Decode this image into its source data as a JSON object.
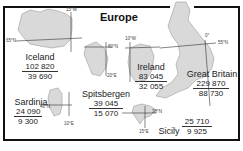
{
  "title": "Europe",
  "units": {
    "top": "km²",
    "bottom": "mi²"
  },
  "islands": [
    {
      "name": "Iceland",
      "area_km2": "102 820",
      "area_mi2": "39 690",
      "coords": [
        "15°W",
        "65°N"
      ]
    },
    {
      "name": "Spitsbergen",
      "area_km2": "39 045",
      "area_mi2": "15 070",
      "coords": [
        "80°N",
        "20°E"
      ]
    },
    {
      "name": "Ireland",
      "area_km2": "83 045",
      "area_mi2": "32 055",
      "coords": [
        "10°W"
      ]
    },
    {
      "name": "Great Britain",
      "area_km2": "229 870",
      "area_mi2": "88 730",
      "coords": [
        "0°",
        "55°N"
      ]
    },
    {
      "name": "Sardinia",
      "area_km2": "24 090",
      "area_mi2": "9 300",
      "coords": [
        "40°N",
        "10°E"
      ]
    },
    {
      "name": "Sicily",
      "area_km2": "25 710",
      "area_mi2": "9 925",
      "coords": [
        "38°N",
        "15°E"
      ]
    }
  ],
  "colors": {
    "land": "#d9d9d9",
    "land_stroke": "#9a9a9a",
    "frame": "#111111",
    "grid": "#333333"
  }
}
